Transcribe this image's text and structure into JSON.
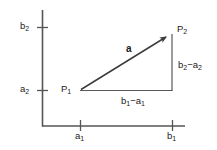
{
  "figure": {
    "type": "vector-diagram",
    "background_color": "#ffffff",
    "line_color": "#4a4a4a",
    "text_color": "#1a1a1a"
  },
  "axes": {
    "x_axis": {
      "name": "horizontal-axis",
      "start_px": 42,
      "end_px": 185,
      "y_px": 126
    },
    "y_axis": {
      "name": "vertical-axis",
      "start_px": 10,
      "end_px": 126,
      "x_px": 42
    },
    "y_ticks": [
      {
        "label": "b",
        "subscript": "2",
        "y_px": 27
      },
      {
        "label": "a",
        "subscript": "2",
        "y_px": 90
      }
    ],
    "x_ticks": [
      {
        "label": "a",
        "subscript": "1",
        "x_px": 80
      },
      {
        "label": "b",
        "subscript": "1",
        "x_px": 172
      }
    ]
  },
  "points": {
    "p1": {
      "label": "P",
      "subscript": "1",
      "x_px": 80,
      "y_px": 90,
      "coordinates": [
        "a1",
        "a2"
      ]
    },
    "p2": {
      "label": "P",
      "subscript": "2",
      "x_px": 172,
      "y_px": 33,
      "coordinates": [
        "b1",
        "b2"
      ]
    }
  },
  "vector": {
    "label": "a",
    "style": "bold-italic-free",
    "from": "p1",
    "to": "p2",
    "arrowhead": "filled-triangle"
  },
  "components": {
    "horizontal": {
      "label_left": "b",
      "label_left_sub": "1",
      "operator": "−",
      "label_right": "a",
      "label_right_sub": "1",
      "full_text": "b₁−a₁"
    },
    "vertical": {
      "label_left": "b",
      "label_left_sub": "2",
      "operator": "−",
      "label_right": "a",
      "label_right_sub": "2",
      "full_text": "b₂−a₂"
    }
  },
  "labels": {
    "b2_base": "b",
    "b2_sub": "2",
    "a2_base": "a",
    "a2_sub": "2",
    "a1_base": "a",
    "a1_sub": "1",
    "b1_base": "b",
    "b1_sub": "1",
    "p1_base": "P",
    "p1_sub": "1",
    "p2_base": "P",
    "p2_sub": "2",
    "vector_a": "a",
    "dx_b": "b",
    "dx_b_sub": "1",
    "dx_minus": "−",
    "dx_a": "a",
    "dx_a_sub": "1",
    "dy_b": "b",
    "dy_b_sub": "2",
    "dy_minus": "−",
    "dy_a": "a",
    "dy_a_sub": "2"
  }
}
